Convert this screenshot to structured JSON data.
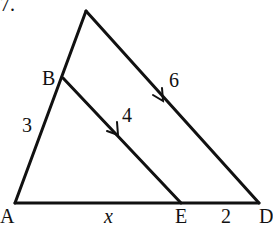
{
  "problem_number": "7.",
  "points": {
    "A": "A",
    "B": "B",
    "E": "E",
    "D": "D"
  },
  "segment_labels": {
    "AB": "3",
    "BE": "4",
    "CD": "6",
    "AE": "x",
    "ED": "2"
  },
  "colors": {
    "stroke": "#111111",
    "background": "#ffffff"
  }
}
